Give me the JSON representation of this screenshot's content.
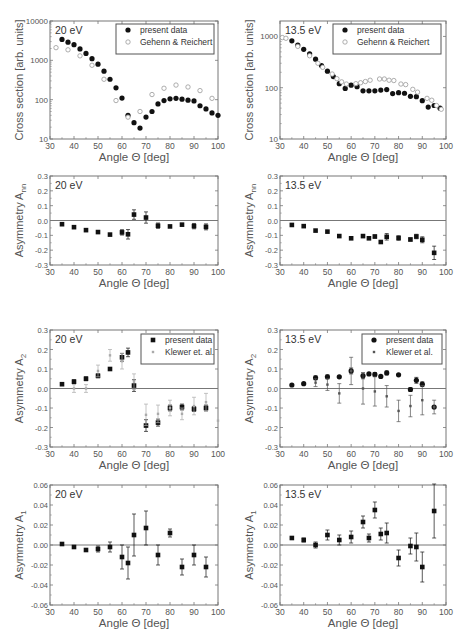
{
  "chart_data": [
    {
      "id": "cs20",
      "type": "scatter",
      "panel": "top-left",
      "label": "20 eV",
      "yscale": "log",
      "ylabel": "Cross section [arb. units]",
      "xlabel": "Angle Θ [deg]",
      "xlim": [
        30,
        100
      ],
      "ylim": [
        10,
        10000
      ],
      "xticks": [
        30,
        40,
        50,
        60,
        70,
        80,
        90,
        100
      ],
      "yticks": [
        10,
        100,
        1000,
        10000
      ],
      "ytick_labels": [
        "10",
        "100",
        "1000",
        "10000"
      ],
      "zero_line": false,
      "frame": {
        "x0": 50,
        "x1": 218,
        "y0": 21,
        "y1": 139
      },
      "legend": {
        "x": 116,
        "y": 24,
        "w": 98,
        "h": 30,
        "entries": [
          "present data",
          "Gehenn & Reichert"
        ]
      },
      "series": [
        {
          "name": "present data",
          "marker": "filled-circle",
          "x": [
            35,
            37.5,
            40,
            42.5,
            45,
            47.5,
            50,
            52.5,
            55,
            57.5,
            60,
            62.5,
            65,
            67.5,
            70,
            72.5,
            75,
            77.5,
            80,
            82.5,
            85,
            87.5,
            90,
            92.5,
            95,
            97.5,
            100
          ],
          "y": [
            3400,
            2900,
            2500,
            1950,
            1500,
            1100,
            800,
            530,
            330,
            200,
            110,
            40,
            26,
            19,
            36,
            50,
            78,
            95,
            105,
            108,
            103,
            97,
            93,
            70,
            58,
            46,
            40
          ]
        },
        {
          "name": "Gehenn & Reichert",
          "marker": "open-circle",
          "x": [
            32.5,
            37.5,
            42.5,
            47.5,
            52.5,
            57.5,
            62.5,
            67.5,
            72.5,
            77.5,
            82.5,
            87.5,
            92.5,
            97.5
          ],
          "y": [
            2100,
            1850,
            1300,
            750,
            330,
            95,
            36,
            50,
            135,
            195,
            235,
            210,
            170,
            108
          ]
        }
      ]
    },
    {
      "id": "cs135",
      "type": "scatter",
      "panel": "top-right",
      "label": "13.5 eV",
      "yscale": "log",
      "ylabel": "Cross section [arb. units]",
      "xlabel": "Angle Θ [deg]",
      "xlim": [
        30,
        100
      ],
      "ylim": [
        10,
        2000
      ],
      "xticks": [
        30,
        40,
        50,
        60,
        70,
        80,
        90,
        100
      ],
      "yticks": [
        10,
        100,
        1000
      ],
      "ytick_labels": [
        "10",
        "100",
        "1000"
      ],
      "zero_line": false,
      "frame": {
        "x0": 280,
        "x1": 446,
        "y0": 21,
        "y1": 139
      },
      "legend": {
        "x": 333,
        "y": 24,
        "w": 108,
        "h": 30,
        "entries": [
          "present data",
          "Gehenn & Reichert"
        ]
      },
      "series": [
        {
          "name": "present data",
          "marker": "filled-circle",
          "x": [
            35,
            37.5,
            40,
            42.5,
            45,
            47.5,
            50,
            52.5,
            55,
            57.5,
            60,
            62.5,
            65,
            67.5,
            70,
            72.5,
            75,
            77.5,
            80,
            82.5,
            85,
            87.5,
            90,
            92.5,
            95,
            97.5
          ],
          "y": [
            820,
            680,
            560,
            460,
            360,
            270,
            210,
            165,
            120,
            97,
            112,
            105,
            87,
            87,
            87,
            90,
            92,
            77,
            80,
            78,
            68,
            67,
            56,
            42,
            45,
            40
          ]
        },
        {
          "name": "Gehenn & Reichert",
          "marker": "open-circle",
          "x": [
            31,
            32.5,
            37.5,
            42.5,
            46,
            48,
            52,
            54,
            56,
            58,
            62,
            64,
            66,
            68,
            72,
            74,
            76,
            78,
            81,
            83,
            86,
            88,
            92,
            94,
            96,
            98
          ],
          "y": [
            950,
            920,
            640,
            420,
            300,
            250,
            185,
            150,
            130,
            118,
            120,
            125,
            132,
            140,
            148,
            148,
            140,
            138,
            118,
            115,
            93,
            82,
            62,
            57,
            45,
            38
          ]
        }
      ]
    },
    {
      "id": "ann20",
      "type": "scatter",
      "panel": "row2-left",
      "label": "20 eV",
      "yscale": "linear",
      "ylabel": "Asymmetry A",
      "ylabel_sub": "nn",
      "xlabel": "Angle Θ [deg]",
      "xlim": [
        30,
        100
      ],
      "ylim": [
        -0.3,
        0.3
      ],
      "xticks": [
        30,
        40,
        50,
        60,
        70,
        80,
        90,
        100
      ],
      "yticks": [
        -0.3,
        -0.2,
        -0.1,
        0.0,
        0.1,
        0.2,
        0.3
      ],
      "ytick_labels": [
        "-0.3",
        "-0.2",
        "-0.1",
        "0.0",
        "0.1",
        "0.2",
        "0.3"
      ],
      "zero_line": true,
      "frame": {
        "x0": 50,
        "x1": 218,
        "y0": 176,
        "y1": 265
      },
      "series": [
        {
          "name": "present data",
          "marker": "filled-square",
          "x": [
            35,
            40,
            45,
            50,
            55,
            60,
            62.5,
            65,
            70,
            75,
            80,
            85,
            90,
            95
          ],
          "y": [
            -0.025,
            -0.045,
            -0.065,
            -0.078,
            -0.095,
            -0.08,
            -0.093,
            0.04,
            0.02,
            -0.035,
            -0.04,
            -0.028,
            -0.038,
            -0.043
          ],
          "err": [
            0,
            0,
            0,
            0,
            0,
            0.018,
            0.032,
            0.032,
            0.038,
            0.018,
            0,
            0,
            0.018,
            0.02
          ]
        }
      ]
    },
    {
      "id": "ann135",
      "type": "scatter",
      "panel": "row2-right",
      "label": "13.5 eV",
      "yscale": "linear",
      "ylabel": "Asymmetry A",
      "ylabel_sub": "nn",
      "xlabel": "Angle Θ [deg]",
      "xlim": [
        30,
        100
      ],
      "ylim": [
        -0.3,
        0.3
      ],
      "xticks": [
        30,
        40,
        50,
        60,
        70,
        80,
        90,
        100
      ],
      "yticks": [
        -0.3,
        -0.2,
        -0.1,
        0.0,
        0.1,
        0.2,
        0.3
      ],
      "ytick_labels": [
        "-0.3",
        "-0.2",
        "-0.1",
        "0.0",
        "0.1",
        "0.2",
        "0.3"
      ],
      "zero_line": true,
      "frame": {
        "x0": 280,
        "x1": 446,
        "y0": 176,
        "y1": 265
      },
      "series": [
        {
          "name": "present data",
          "marker": "filled-square",
          "x": [
            35,
            40,
            45,
            50,
            55,
            60,
            65,
            67.5,
            70,
            72.5,
            75,
            80,
            85,
            87.5,
            90,
            95
          ],
          "y": [
            -0.03,
            -0.038,
            -0.068,
            -0.075,
            -0.105,
            -0.12,
            -0.105,
            -0.12,
            -0.108,
            -0.145,
            -0.11,
            -0.118,
            -0.128,
            -0.108,
            -0.13,
            -0.218
          ],
          "err": [
            0,
            0,
            0,
            0,
            0,
            0,
            0.01,
            0,
            0.01,
            0,
            0.022,
            0.015,
            0.01,
            0.015,
            0.02,
            0.045
          ]
        }
      ]
    },
    {
      "id": "a2_20",
      "type": "scatter",
      "panel": "row3-left",
      "label": "20 eV",
      "yscale": "linear",
      "ylabel": "Asymmetry A",
      "ylabel_sub": "2",
      "xlabel": "Angle Θ [deg]",
      "xlim": [
        30,
        100
      ],
      "ylim": [
        -0.3,
        0.3
      ],
      "xticks": [
        30,
        40,
        50,
        60,
        70,
        80,
        90,
        100
      ],
      "yticks": [
        -0.3,
        -0.2,
        -0.1,
        0.0,
        0.1,
        0.2,
        0.3
      ],
      "ytick_labels": [
        "-0.3",
        "-0.2",
        "-0.1",
        "0.0",
        "0.1",
        "0.2",
        "0.3"
      ],
      "zero_line": true,
      "frame": {
        "x0": 50,
        "x1": 218,
        "y0": 330,
        "y1": 447
      },
      "legend": {
        "x": 141,
        "y": 334,
        "w": 73,
        "h": 30,
        "entries": [
          "present data",
          "Klewer et. al."
        ]
      },
      "series": [
        {
          "name": "present data",
          "marker": "filled-square",
          "x": [
            35,
            40,
            45,
            50,
            55,
            60,
            62.5,
            65,
            70,
            75,
            80,
            85,
            90,
            95
          ],
          "y": [
            0.022,
            0.035,
            0.05,
            0.065,
            0.1,
            0.16,
            0.185,
            0.015,
            -0.19,
            -0.175,
            -0.1,
            -0.095,
            -0.105,
            -0.1
          ],
          "err": [
            0,
            0.01,
            0.01,
            0.01,
            0,
            0.02,
            0.022,
            0.03,
            0.03,
            0.018,
            0.015,
            0.015,
            0.012,
            0.015
          ]
        },
        {
          "name": "Klewer et. al.",
          "marker": "small-gray",
          "x": [
            40,
            45,
            50,
            55,
            60,
            65,
            70,
            75,
            80,
            85,
            90,
            95,
            100
          ],
          "y": [
            0.0,
            0.0,
            0.09,
            0.17,
            0.14,
            0.035,
            -0.135,
            -0.13,
            -0.1,
            -0.13,
            -0.09,
            -0.07,
            -0.165
          ],
          "err": [
            0.02,
            0.02,
            0.03,
            0.03,
            0.04,
            0.04,
            0.055,
            0.045,
            0.04,
            0.03,
            0.045,
            0.045,
            0
          ]
        }
      ]
    },
    {
      "id": "a2_135",
      "type": "scatter",
      "panel": "row3-right",
      "label": "13.5 eV",
      "yscale": "linear",
      "ylabel": "Asymmetry A",
      "ylabel_sub": "2",
      "xlabel": "Angle Θ [deg]",
      "xlim": [
        30,
        100
      ],
      "ylim": [
        -0.3,
        0.3
      ],
      "xticks": [
        30,
        40,
        50,
        60,
        70,
        80,
        90,
        100
      ],
      "yticks": [
        -0.3,
        -0.2,
        -0.1,
        0.0,
        0.1,
        0.2,
        0.3
      ],
      "ytick_labels": [
        "-0.3",
        "-0.2",
        "-0.1",
        "0.0",
        "0.1",
        "0.2",
        "0.3"
      ],
      "zero_line": true,
      "frame": {
        "x0": 280,
        "x1": 446,
        "y0": 330,
        "y1": 447
      },
      "legend": {
        "x": 362,
        "y": 334,
        "w": 80,
        "h": 30,
        "entries": [
          "present data",
          "Klewer et al."
        ]
      },
      "series": [
        {
          "name": "present data",
          "marker": "filled-circle",
          "x": [
            35,
            40,
            45,
            50,
            55,
            60,
            65,
            67.5,
            70,
            72.5,
            75,
            80,
            85,
            87.5,
            90,
            95
          ],
          "y": [
            0.018,
            0.025,
            0.055,
            0.06,
            0.06,
            0.09,
            0.065,
            0.075,
            0.072,
            0.062,
            0.08,
            0.07,
            -0.005,
            0.042,
            0.022,
            -0.095
          ],
          "err": [
            0,
            0,
            0.01,
            0.01,
            0,
            0.015,
            0.015,
            0,
            0.01,
            0,
            0.01,
            0,
            0.01,
            0.015,
            0.012,
            0
          ]
        },
        {
          "name": "Klewer et al.",
          "marker": "small-dark",
          "x": [
            45,
            50,
            55,
            60,
            65,
            70,
            75,
            80,
            85,
            90,
            95
          ],
          "y": [
            0.03,
            0.02,
            -0.025,
            0.09,
            0.0,
            -0.015,
            -0.04,
            -0.115,
            -0.09,
            -0.06,
            -0.095
          ],
          "err": [
            0.02,
            0.03,
            0.05,
            0.07,
            0.08,
            0.075,
            0.055,
            0.055,
            0.055,
            0.075,
            0.035
          ]
        }
      ]
    },
    {
      "id": "a1_20",
      "type": "scatter",
      "panel": "row4-left",
      "label": "20 eV",
      "yscale": "linear",
      "ylabel": "Asymmetry A",
      "ylabel_sub": "1",
      "xlabel": "Angle Θ [deg]",
      "xlim": [
        30,
        100
      ],
      "ylim": [
        -0.06,
        0.06
      ],
      "xticks": [
        30,
        40,
        50,
        60,
        70,
        80,
        90,
        100
      ],
      "yticks": [
        -0.06,
        -0.04,
        -0.02,
        0.0,
        0.02,
        0.04,
        0.06
      ],
      "ytick_labels": [
        "-0.06",
        "-0.04",
        "-0.02",
        "0.00",
        "0.02",
        "0.04",
        "0.06"
      ],
      "zero_line": true,
      "frame": {
        "x0": 50,
        "x1": 218,
        "y0": 485,
        "y1": 605
      },
      "series": [
        {
          "name": "present data",
          "marker": "filled-square",
          "x": [
            35,
            40,
            45,
            50,
            55,
            60,
            62.5,
            65,
            70,
            75,
            80,
            85,
            90,
            95
          ],
          "y": [
            0.001,
            -0.002,
            -0.005,
            -0.004,
            -0.002,
            -0.012,
            -0.018,
            0.01,
            0.017,
            -0.01,
            0.012,
            -0.022,
            -0.01,
            -0.022
          ],
          "err": [
            0,
            0,
            0,
            0.003,
            0.005,
            0.012,
            0.016,
            0.021,
            0.017,
            0.01,
            0.004,
            0.008,
            0.01,
            0.01
          ]
        }
      ]
    },
    {
      "id": "a1_135",
      "type": "scatter",
      "panel": "row4-right",
      "label": "13.5 eV",
      "yscale": "linear",
      "ylabel": "Asymmetry A",
      "ylabel_sub": "1",
      "xlabel": "Angle Θ [deg]",
      "xlim": [
        30,
        100
      ],
      "ylim": [
        -0.06,
        0.06
      ],
      "xticks": [
        30,
        40,
        50,
        60,
        70,
        80,
        90,
        100
      ],
      "yticks": [
        -0.06,
        -0.04,
        -0.02,
        0.0,
        0.02,
        0.04,
        0.06
      ],
      "ytick_labels": [
        "-0.06",
        "-0.04",
        "-0.02",
        "0.00",
        "0.02",
        "0.04",
        "0.06"
      ],
      "zero_line": true,
      "frame": {
        "x0": 280,
        "x1": 446,
        "y0": 485,
        "y1": 605
      },
      "series": [
        {
          "name": "present data",
          "marker": "filled-square",
          "x": [
            35,
            40,
            45,
            50,
            55,
            60,
            65,
            67.5,
            70,
            72.5,
            75,
            80,
            85,
            87.5,
            90,
            95
          ],
          "y": [
            0.007,
            0.005,
            0.0,
            0.01,
            0.005,
            0.008,
            0.023,
            0.007,
            0.035,
            0.011,
            0.012,
            -0.013,
            -0.001,
            -0.002,
            -0.022,
            0.034
          ],
          "err": [
            0,
            0.002,
            0.003,
            0.005,
            0.005,
            0.006,
            0.006,
            0.004,
            0.008,
            0.006,
            0.01,
            0.008,
            0.008,
            0.014,
            0.015,
            0.027
          ]
        }
      ]
    }
  ],
  "colors": {
    "frame": "#777777",
    "present_data": "#111111",
    "reference_open": "#999999",
    "klewer_light": "#aaaaaa",
    "klewer_dark": "#555555",
    "text": "#555555"
  }
}
